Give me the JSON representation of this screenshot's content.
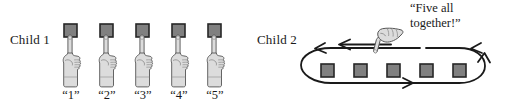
{
  "figure": {
    "background_color": "#ffffff",
    "line_color": "#1a1a1a",
    "square_fill": "#808080",
    "square_border": "#262626",
    "hand_fill": "#dcdcdc",
    "hand_outline": "#555555"
  },
  "child1": {
    "label": "Child 1",
    "object_count": 5,
    "hand_count": 5,
    "hands_gesture": "pointing-up-index-finger",
    "count_labels": [
      "“1”",
      "“2”",
      "“3”",
      "“4”",
      "“5”"
    ]
  },
  "child2": {
    "label": "Child 2",
    "object_count": 5,
    "speech": "“Five all\ntogether!”",
    "hand_gesture": "pointing-down-left-index-finger",
    "loop_direction": "counterclockwise",
    "loop_arrow_count": 4,
    "sweep_arrow": "arrow-pointing-left"
  }
}
